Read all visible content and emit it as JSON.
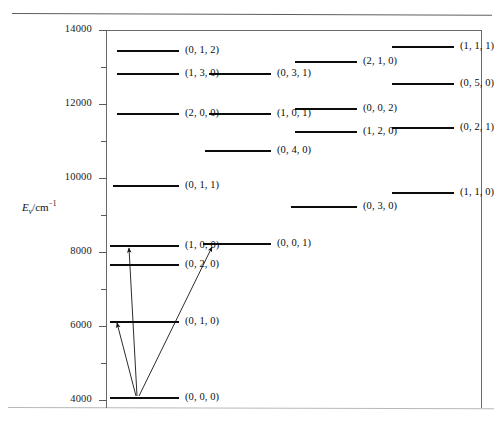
{
  "figure": {
    "kind": "vibrational-energy-level-diagram",
    "axis": {
      "title_symbol": "E",
      "title_subscript": "v",
      "title_unit": "/cm",
      "title_exponent": "−1",
      "min": 4000,
      "max": 14000,
      "major_ticks": [
        4000,
        6000,
        8000,
        10000,
        12000,
        14000
      ],
      "major_tick_labels": [
        "4000",
        "6000",
        "8000",
        "10000",
        "12000",
        "14000"
      ],
      "minor_ticks": [
        5000,
        7000,
        9000,
        11000,
        13000
      ],
      "units": "cm^-1"
    },
    "line_color": "#0c0c0c",
    "axis_color": "#6a6a6a"
  },
  "chart_data": {
    "type": "scatter",
    "title": "",
    "xlabel": "",
    "ylabel": "E_v/cm^-1",
    "ylim": [
      4000,
      14000
    ],
    "xlim": [
      0,
      4
    ],
    "grid": false,
    "legend": "none",
    "series": [
      {
        "name": "vibrational levels",
        "points": [
          {
            "label": "(0, 0, 0)",
            "energy": 4530,
            "column": 1
          },
          {
            "label": "(0, 1, 0)",
            "energy": 6080,
            "column": 1
          },
          {
            "label": "(0, 2, 0)",
            "energy": 7620,
            "column": 1
          },
          {
            "label": "(1, 0; 0)",
            "energy": 8170,
            "column": 1
          },
          {
            "label": "(0, 0, 1)",
            "energy": 8200,
            "column": 2
          },
          {
            "label": "(0, 1, 1)",
            "energy": 9880,
            "column": 1
          },
          {
            "label": "(1, 1, 0)",
            "energy": 9880,
            "column": 4
          },
          {
            "label": "(0, 3, 0)",
            "energy": 9520,
            "column": 3
          },
          {
            "label": "(0, 4, 0)",
            "energy": 10770,
            "column": 2
          },
          {
            "label": "(1, 2, 0)",
            "energy": 11600,
            "column": 3
          },
          {
            "label": "(0, 2, 1)",
            "energy": 11620,
            "column": 4
          },
          {
            "label": "(2, 0, 0)",
            "energy": 11860,
            "column": 1
          },
          {
            "label": "(1, 0, 1)",
            "energy": 11860,
            "column": 2
          },
          {
            "label": "(0, 0, 2)",
            "energy": 11950,
            "column": 3
          },
          {
            "label": "(0, 5, 0)",
            "energy": 12380,
            "column": 4
          },
          {
            "label": "(1, 3, 0)",
            "energy": 13000,
            "column": 1
          },
          {
            "label": "(0, 3, 1)",
            "energy": 13000,
            "column": 2
          },
          {
            "label": "(2, 1, 0)",
            "energy": 13280,
            "column": 3
          },
          {
            "label": "(1, 1, 1)",
            "energy": 13370,
            "column": 4
          }
        ]
      }
    ],
    "annotations": [
      {
        "type": "arrow",
        "from": "(0, 0, 0)",
        "to": "(0, 1, 0)"
      },
      {
        "type": "arrow",
        "from": "(0, 0, 0)",
        "to": "(1, 0; 0)"
      },
      {
        "type": "arrow",
        "from": "(0, 0, 0)",
        "to": "(0, 0, 1)"
      }
    ]
  },
  "levels": [
    {
      "label": "(0, 1, 2)",
      "x": 117,
      "y": 50,
      "w": 62,
      "lx": 185,
      "ly": 44
    },
    {
      "label": "(1, 3, 0)",
      "x": 117,
      "y": 73,
      "w": 62,
      "lx": 185,
      "ly": 67
    },
    {
      "label": "(2, 0, 0)",
      "x": 117,
      "y": 113,
      "w": 62,
      "lx": 185,
      "ly": 107
    },
    {
      "label": "(0, 1, 1)",
      "x": 113,
      "y": 185,
      "w": 66,
      "lx": 185,
      "ly": 179
    },
    {
      "label": "(1, 0; 0)",
      "x": 110,
      "y": 245,
      "w": 69,
      "lx": 185,
      "ly": 239
    },
    {
      "label": "(0, 2, 0)",
      "x": 110,
      "y": 264,
      "w": 69,
      "lx": 185,
      "ly": 258
    },
    {
      "label": "(0, 1, 0)",
      "x": 110,
      "y": 321,
      "w": 69,
      "lx": 185,
      "ly": 315
    },
    {
      "label": "(0, 0, 0)",
      "x": 110,
      "y": 397,
      "w": 69,
      "lx": 185,
      "ly": 391
    },
    {
      "label": "(0, 3, 1)",
      "x": 209,
      "y": 73,
      "w": 62,
      "lx": 277,
      "ly": 67
    },
    {
      "label": "(1, 0, 1)",
      "x": 209,
      "y": 113,
      "w": 62,
      "lx": 277,
      "ly": 107
    },
    {
      "label": "(0, 4, 0)",
      "x": 205,
      "y": 150,
      "w": 66,
      "lx": 277,
      "ly": 144
    },
    {
      "label": "(0, 0, 1)",
      "x": 203,
      "y": 243,
      "w": 68,
      "lx": 277,
      "ly": 237
    },
    {
      "label": "(2, 1, 0)",
      "x": 295,
      "y": 61,
      "w": 62,
      "lx": 363,
      "ly": 55
    },
    {
      "label": "(0, 0, 2)",
      "x": 295,
      "y": 108,
      "w": 62,
      "lx": 363,
      "ly": 102
    },
    {
      "label": "(1, 2, 0)",
      "x": 295,
      "y": 131,
      "w": 62,
      "lx": 363,
      "ly": 125
    },
    {
      "label": "(0, 3, 0)",
      "x": 291,
      "y": 206,
      "w": 66,
      "lx": 363,
      "ly": 200
    },
    {
      "label": "(1, 1, 1)",
      "x": 392,
      "y": 46,
      "w": 62,
      "lx": 460,
      "ly": 40
    },
    {
      "label": "(0, 5, 0)",
      "x": 392,
      "y": 83,
      "w": 62,
      "lx": 460,
      "ly": 77
    },
    {
      "label": "(0, 2, 1)",
      "x": 392,
      "y": 127,
      "w": 62,
      "lx": 460,
      "ly": 121
    },
    {
      "label": "(1, 1, 0)",
      "x": 392,
      "y": 192,
      "w": 62,
      "lx": 460,
      "ly": 186
    }
  ],
  "ticks": [
    {
      "value": "14000",
      "y": 30,
      "major": true
    },
    {
      "value": "13000",
      "y": 67,
      "major": false
    },
    {
      "value": "12000",
      "y": 104,
      "major": true
    },
    {
      "value": "11000",
      "y": 141,
      "major": false
    },
    {
      "value": "10000",
      "y": 178,
      "major": true
    },
    {
      "value": "9000",
      "y": 215,
      "major": false
    },
    {
      "value": "8000",
      "y": 252,
      "major": true
    },
    {
      "value": "7000",
      "y": 289,
      "major": false
    },
    {
      "value": "6000",
      "y": 326,
      "major": true
    },
    {
      "value": "5000",
      "y": 363,
      "major": false
    },
    {
      "value": "4000",
      "y": 400,
      "major": true
    }
  ],
  "arrows": [
    {
      "name": "transition-to-bend",
      "x1": 136,
      "y1": 396,
      "x2": 117,
      "y2": 323
    },
    {
      "name": "transition-to-symmetric-stretch",
      "x1": 137,
      "y1": 396,
      "x2": 129,
      "y2": 248
    },
    {
      "name": "transition-to-antisymmetric-stretch",
      "x1": 139,
      "y1": 396,
      "x2": 212,
      "y2": 247
    }
  ]
}
